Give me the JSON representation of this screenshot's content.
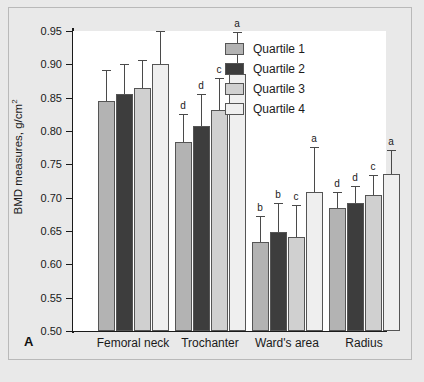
{
  "panel": {
    "label": "A"
  },
  "legend": {
    "position": "top-right",
    "entries": [
      {
        "label": "Quartile 1",
        "color": "#b3b3b3"
      },
      {
        "label": "Quartile 2",
        "color": "#3d3d3d"
      },
      {
        "label": "Quartile 3",
        "color": "#d0d0d0"
      },
      {
        "label": "Quartile 4",
        "color": "#efefef"
      }
    ]
  },
  "chart_data": {
    "type": "bar",
    "title": "",
    "xlabel": "",
    "ylabel": "BMD measures, g/cm2",
    "ylabel_html": "BMD measures, g/cm<sup>2</sup>",
    "ylim": [
      0.5,
      0.95
    ],
    "yticks": [
      0.5,
      0.55,
      0.6,
      0.65,
      0.7,
      0.75,
      0.8,
      0.85,
      0.9,
      0.95
    ],
    "ytick_labels": [
      "0.50",
      "0.55",
      "0.60",
      "0.65",
      "0.70",
      "0.75",
      "0.80",
      "0.85",
      "0.90",
      "0.95"
    ],
    "grid": false,
    "categories": [
      "Femoral neck",
      "Trochanter",
      "Ward's area",
      "Radius"
    ],
    "series": [
      {
        "name": "Quartile 1",
        "color": "#b3b3b3",
        "values": [
          0.845,
          0.783,
          0.633,
          0.684
        ],
        "errors": [
          0.047,
          0.043,
          0.04,
          0.024
        ],
        "annotations": [
          "",
          "d",
          "b",
          "d"
        ]
      },
      {
        "name": "Quartile 2",
        "color": "#3d3d3d",
        "values": [
          0.856,
          0.807,
          0.648,
          0.692
        ],
        "errors": [
          0.044,
          0.048,
          0.044,
          0.025
        ],
        "annotations": [
          "",
          "d",
          "b",
          "d"
        ]
      },
      {
        "name": "Quartile 3",
        "color": "#d0d0d0",
        "values": [
          0.864,
          0.831,
          0.641,
          0.704
        ],
        "errors": [
          0.043,
          0.049,
          0.048,
          0.03
        ]
      },
      {
        "name": "Quartile 4",
        "color": "#efefef",
        "values": [
          0.9,
          0.886,
          0.708,
          0.736
        ],
        "errors": [
          0.05,
          0.063,
          0.068,
          0.036
        ],
        "annotations": [
          "",
          "a",
          "a",
          "a"
        ]
      }
    ],
    "annotation_note": "letters a, b, c, d denote significance markers above error bars"
  }
}
